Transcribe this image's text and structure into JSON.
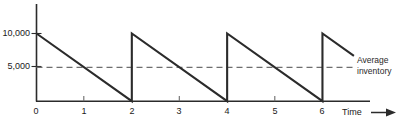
{
  "chart_data": {
    "type": "line",
    "title": "",
    "subtitle": "",
    "xlabel": "Time",
    "ylabel": "",
    "xlim": [
      0,
      6.7
    ],
    "ylim": [
      0,
      11500
    ],
    "grid": false,
    "legend_position": "none",
    "x_ticks": [
      "0",
      "1",
      "2",
      "3",
      "4",
      "5",
      "6"
    ],
    "x_tick_values": [
      0,
      1,
      2,
      3,
      4,
      5,
      6
    ],
    "y_ticks": [
      "5,000",
      "10,000"
    ],
    "y_tick_values": [
      5000,
      10000
    ],
    "series": [
      {
        "name": "Inventory level",
        "style": "solid",
        "color": "#2b2b2b",
        "points": [
          {
            "x": 0,
            "y": 10000
          },
          {
            "x": 2,
            "y": 0
          },
          {
            "x": 2,
            "y": 10000
          },
          {
            "x": 4,
            "y": 0
          },
          {
            "x": 4,
            "y": 10000
          },
          {
            "x": 6,
            "y": 0
          },
          {
            "x": 6,
            "y": 10000
          },
          {
            "x": 6.66,
            "y": 6700
          }
        ]
      },
      {
        "name": "Average inventory",
        "style": "dashed",
        "color": "#6e6e6e",
        "level": 5000,
        "x_start": 0,
        "x_end": 6.68
      }
    ],
    "annotations": [
      {
        "name": "average-inventory",
        "text_lines": [
          "Average",
          "inventory"
        ],
        "target_value": 5000
      }
    ],
    "axis_arrow": true,
    "reorder_quantity": 10000,
    "cycle_length": 2,
    "number_of_cycles": 3
  },
  "axes": {
    "x_axis_name": "Time",
    "y_axis_name": ""
  },
  "ticks": {
    "x": [
      {
        "label": "0"
      },
      {
        "label": "1"
      },
      {
        "label": "2"
      },
      {
        "label": "3"
      },
      {
        "label": "4"
      },
      {
        "label": "5"
      },
      {
        "label": "6"
      }
    ],
    "y": [
      {
        "label": "5,000"
      },
      {
        "label": "10,000"
      }
    ]
  },
  "annotation": {
    "line1": "Average",
    "line2": "inventory"
  },
  "colors": {
    "series_line": "#2b2b2b",
    "average_line": "#6e6e6e",
    "axis": "#2b2b2b",
    "text": "#1a1a1a",
    "background": "#ffffff"
  }
}
